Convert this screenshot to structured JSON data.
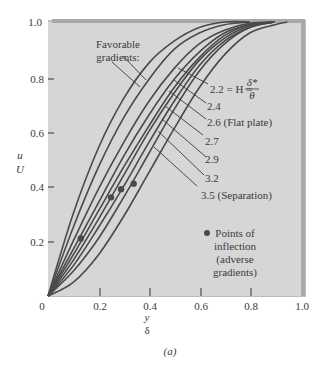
{
  "figure": {
    "caption": "(a)"
  },
  "chart_data": {
    "type": "line",
    "title": "",
    "xlabel_top": "y",
    "xlabel_bottom": "δ",
    "ylabel_top": "u",
    "ylabel_bottom": "U",
    "xlim": [
      0,
      1.0
    ],
    "ylim": [
      0,
      1.0
    ],
    "x_ticks": [
      "0",
      "0.2",
      "0.4",
      "0.6",
      "0.8",
      "1.0"
    ],
    "y_ticks": [
      "0.2",
      "0.4",
      "0.6",
      "0.8",
      "1.0"
    ],
    "grid": false,
    "background": "#d6d6d6",
    "line_color": "#4a4a4a",
    "annotations": {
      "favorable": "Favorable",
      "favorable2": "gradients:",
      "h_prefix": "2.2 = H = ",
      "h_num": "δ*",
      "h_den": "θ",
      "inflection_line1": "Points of",
      "inflection_line2": "inflection",
      "inflection_line3": "(adverse",
      "inflection_line4": "gradients)"
    },
    "series": [
      {
        "name": "Favorable 1",
        "label": "",
        "x": [
          0,
          0.1,
          0.2,
          0.3,
          0.4,
          0.5,
          0.6,
          0.7,
          0.8
        ],
        "y": [
          0,
          0.3,
          0.54,
          0.72,
          0.85,
          0.93,
          0.98,
          1.0,
          1.0
        ]
      },
      {
        "name": "Favorable 2",
        "label": "",
        "x": [
          0,
          0.1,
          0.2,
          0.3,
          0.4,
          0.5,
          0.6,
          0.7,
          0.8
        ],
        "y": [
          0,
          0.25,
          0.47,
          0.65,
          0.79,
          0.9,
          0.96,
          0.99,
          1.0
        ]
      },
      {
        "name": "H=2.2",
        "label": "2.2",
        "x": [
          0,
          0.1,
          0.2,
          0.3,
          0.4,
          0.5,
          0.6,
          0.7,
          0.8,
          0.9
        ],
        "y": [
          0,
          0.2,
          0.39,
          0.56,
          0.71,
          0.83,
          0.92,
          0.97,
          0.995,
          1.0
        ]
      },
      {
        "name": "H=2.4",
        "label": "2.4",
        "x": [
          0,
          0.1,
          0.2,
          0.3,
          0.4,
          0.5,
          0.6,
          0.7,
          0.8,
          0.9
        ],
        "y": [
          0,
          0.17,
          0.34,
          0.51,
          0.66,
          0.79,
          0.89,
          0.96,
          0.99,
          1.0
        ]
      },
      {
        "name": "H=2.6 (Flat plate)",
        "label": "2.6 (Flat plate)",
        "x": [
          0,
          0.1,
          0.2,
          0.3,
          0.4,
          0.5,
          0.6,
          0.7,
          0.8,
          0.9
        ],
        "y": [
          0,
          0.15,
          0.31,
          0.47,
          0.62,
          0.76,
          0.87,
          0.95,
          0.99,
          1.0
        ]
      },
      {
        "name": "H=2.7",
        "label": "2.7",
        "x": [
          0,
          0.1,
          0.2,
          0.3,
          0.4,
          0.5,
          0.6,
          0.7,
          0.8,
          0.9
        ],
        "y": [
          0,
          0.13,
          0.28,
          0.44,
          0.6,
          0.74,
          0.86,
          0.94,
          0.985,
          1.0
        ]
      },
      {
        "name": "H=2.9",
        "label": "2.9",
        "x": [
          0,
          0.1,
          0.2,
          0.3,
          0.4,
          0.5,
          0.6,
          0.7,
          0.8,
          0.9
        ],
        "y": [
          0,
          0.11,
          0.25,
          0.4,
          0.56,
          0.71,
          0.84,
          0.93,
          0.98,
          1.0
        ]
      },
      {
        "name": "H=3.2",
        "label": "3.2",
        "x": [
          0,
          0.1,
          0.2,
          0.3,
          0.4,
          0.5,
          0.6,
          0.7,
          0.8,
          0.9
        ],
        "y": [
          0,
          0.09,
          0.21,
          0.36,
          0.52,
          0.68,
          0.82,
          0.92,
          0.98,
          1.0
        ]
      },
      {
        "name": "H=3.5 (Separation)",
        "label": "3.5 (Separation)",
        "x": [
          0,
          0.1,
          0.2,
          0.3,
          0.4,
          0.5,
          0.6,
          0.7,
          0.8,
          0.9,
          0.95
        ],
        "y": [
          0,
          0.05,
          0.15,
          0.29,
          0.45,
          0.61,
          0.76,
          0.88,
          0.96,
          0.99,
          1.0
        ]
      }
    ],
    "inflection_points": [
      {
        "x": 0.13,
        "y": 0.21
      },
      {
        "x": 0.25,
        "y": 0.36
      },
      {
        "x": 0.29,
        "y": 0.39
      },
      {
        "x": 0.34,
        "y": 0.41
      }
    ]
  }
}
